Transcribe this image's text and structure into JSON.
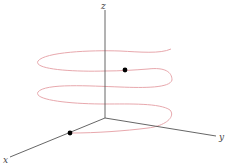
{
  "figure": {
    "axes": {
      "x_label": "x",
      "y_label": "y",
      "z_label": "z"
    },
    "curve": {
      "name": "helix",
      "color": "#e8a8ad"
    },
    "points": [
      {
        "name": "start-point",
        "location": "on x-axis",
        "color": "#000000"
      },
      {
        "name": "point-on-helix",
        "location": "upper loop, front",
        "color": "#000000"
      }
    ],
    "axis_color": "#555555"
  }
}
